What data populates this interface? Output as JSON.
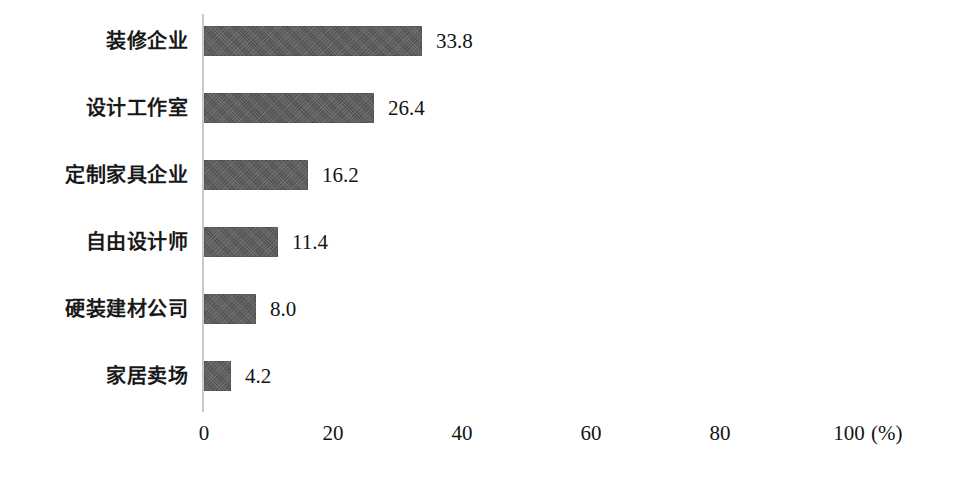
{
  "chart_data": {
    "type": "bar",
    "orientation": "horizontal",
    "title": "",
    "xlabel": "(%)",
    "ylabel": "",
    "xlim": [
      0,
      100
    ],
    "grid": false,
    "legend": "none",
    "x_ticks": [
      "0",
      "20",
      "40",
      "60",
      "80",
      "100"
    ],
    "x_tick_values": [
      0,
      20,
      40,
      60,
      80,
      100
    ],
    "unit_label": "(%)",
    "bar_color": "#5a5a5a",
    "axis_color": "#c9c9c9",
    "categories": [
      "装修企业",
      "设计工作室",
      "定制家具企业",
      "自由设计师",
      "硬装建材公司",
      "家居卖场"
    ],
    "values": [
      33.8,
      26.4,
      16.2,
      11.4,
      8.0,
      4.2
    ],
    "value_labels": [
      "33.8",
      "26.4",
      "16.2",
      "11.4",
      "8.0",
      "4.2"
    ]
  }
}
